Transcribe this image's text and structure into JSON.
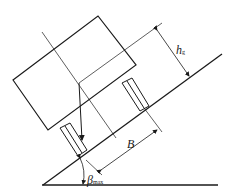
{
  "diagram": {
    "type": "vehicle-on-slope stability diagram",
    "labels": {
      "height": {
        "main": "h",
        "sub": "g"
      },
      "width": {
        "main": "B"
      },
      "angle": {
        "main": "β",
        "sub": "max"
      }
    },
    "colors": {
      "line": "#1a1a1a",
      "background": "#ffffff"
    }
  }
}
